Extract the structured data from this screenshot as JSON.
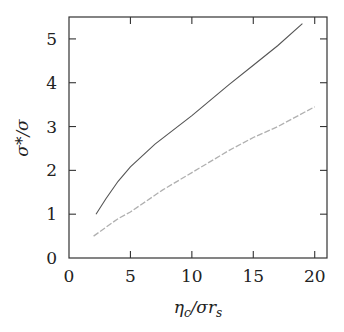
{
  "chart_data": {
    "type": "line",
    "title": "",
    "xlabel": "η_c/σr_s",
    "ylabel": "σ*/σ",
    "xlim": [
      0,
      21
    ],
    "ylim": [
      0,
      5.5
    ],
    "xticks": [
      0,
      5,
      10,
      15,
      20
    ],
    "yticks": [
      0,
      1,
      2,
      3,
      4,
      5
    ],
    "grid": false,
    "legend": null,
    "series": [
      {
        "name": "upper curve (solid, dark)",
        "color": "#555555",
        "x": [
          2.2,
          3,
          4,
          5,
          7,
          10,
          13,
          15,
          17,
          19
        ],
        "y": [
          1.0,
          1.35,
          1.75,
          2.08,
          2.6,
          3.25,
          3.95,
          4.4,
          4.85,
          5.35
        ]
      },
      {
        "name": "lower curve (light, dashed)",
        "color": "#b0b0b0",
        "x": [
          2.0,
          4,
          5,
          7.6,
          10,
          13,
          15,
          17,
          20
        ],
        "y": [
          0.5,
          0.9,
          1.05,
          1.55,
          1.95,
          2.45,
          2.75,
          3.0,
          3.45
        ]
      }
    ]
  },
  "axes": {
    "x_label_main": "η",
    "x_label_sub1": "c",
    "x_label_mid": "/σr",
    "x_label_sub2": "s",
    "y_label": "σ*/σ"
  }
}
